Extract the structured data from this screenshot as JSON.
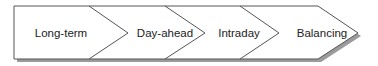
{
  "diagram": {
    "type": "process-chevron-flow",
    "steps": [
      {
        "label": "Long-term"
      },
      {
        "label": "Day-ahead"
      },
      {
        "label": "Intraday"
      },
      {
        "label": "Balancing"
      }
    ],
    "colors": {
      "fill": "#ffffff",
      "stroke": "#555555",
      "shadow": "#8a8a8a"
    }
  }
}
